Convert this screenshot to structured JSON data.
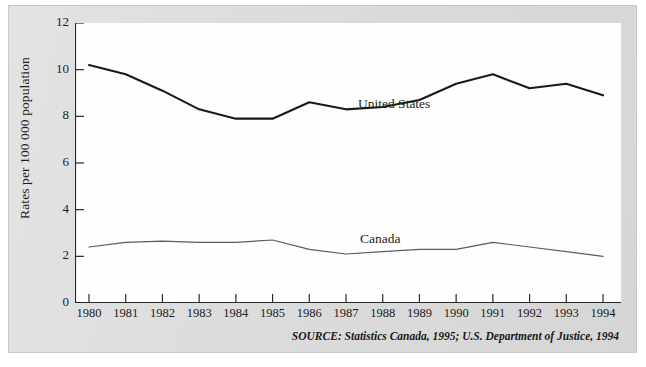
{
  "chart_data": {
    "type": "line",
    "title": "",
    "xlabel": "",
    "ylabel": "Rates per 100 000 population",
    "categories": [
      "1980",
      "1981",
      "1982",
      "1983",
      "1984",
      "1985",
      "1986",
      "1987",
      "1988",
      "1989",
      "1990",
      "1991",
      "1992",
      "1993",
      "1994"
    ],
    "xlim": [
      1980,
      1994
    ],
    "ylim": [
      0,
      12
    ],
    "yticks": [
      0,
      2,
      4,
      6,
      8,
      10,
      12
    ],
    "grid": false,
    "legend_position": "inline-annotation",
    "series": [
      {
        "name": "United States",
        "color": "#1a1a1a",
        "values": [
          10.2,
          9.8,
          9.1,
          8.3,
          7.9,
          7.9,
          8.6,
          8.3,
          8.4,
          8.7,
          9.4,
          9.8,
          9.2,
          9.4,
          8.9
        ]
      },
      {
        "name": "Canada",
        "color": "#5a5a5a",
        "values": [
          2.4,
          2.6,
          2.65,
          2.6,
          2.6,
          2.7,
          2.3,
          2.1,
          2.2,
          2.3,
          2.3,
          2.6,
          2.4,
          2.2,
          2.0
        ]
      }
    ],
    "annotations": [
      {
        "text": "United States",
        "series": "United States"
      },
      {
        "text": "Canada",
        "series": "Canada"
      }
    ],
    "source": "SOURCE: Statistics Canada, 1995; U.S. Department of Justice, 1994"
  },
  "figure": {
    "source_note": "SOURCE: Statistics Canada, 1995; U.S. Department of Justice, 1994",
    "axis_title_y": "Rates per 100 000 population",
    "label_united_states": "United States",
    "label_canada": "Canada"
  }
}
